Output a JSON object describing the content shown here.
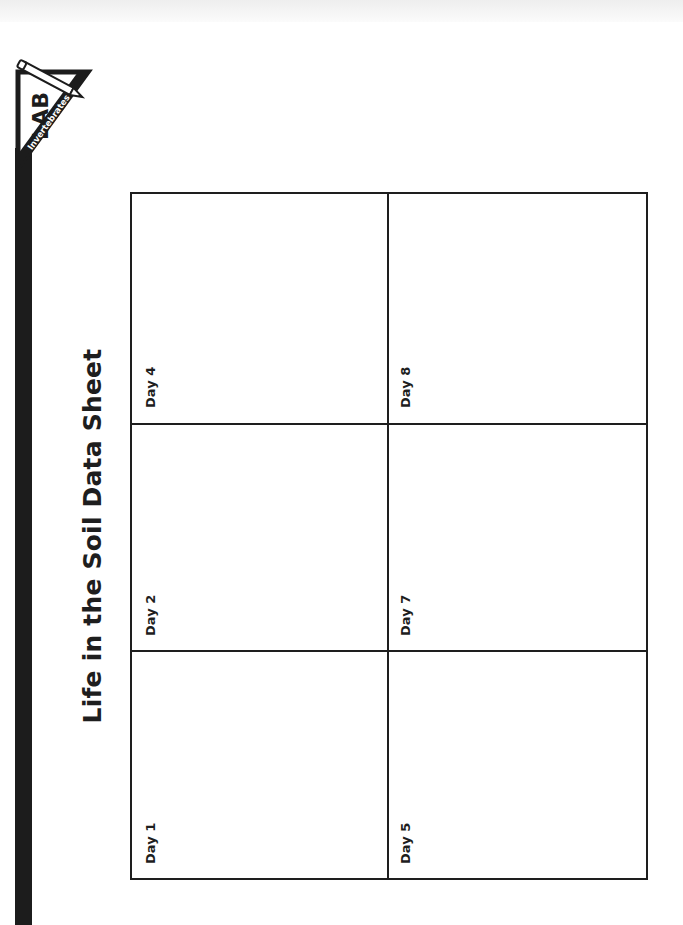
{
  "document": {
    "title": "Life in the Soil Data Sheet",
    "badge": {
      "label": "LAB",
      "subject": "Invertebrates"
    }
  },
  "grid": {
    "columns": 3,
    "rows": 2,
    "cells": [
      {
        "label": "Day 1"
      },
      {
        "label": "Day 2"
      },
      {
        "label": "Day 4"
      },
      {
        "label": "Day 5"
      },
      {
        "label": "Day 7"
      },
      {
        "label": "Day 8"
      }
    ]
  },
  "colors": {
    "ink": "#1e1e1e",
    "paper": "#ffffff",
    "sidebar": "#1c1c1c"
  }
}
